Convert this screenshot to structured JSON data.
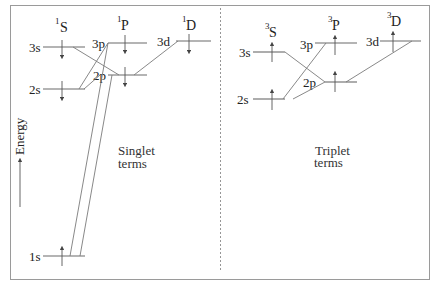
{
  "diagram": {
    "type": "energy-level-diagram",
    "axis_label": "Energy",
    "colors": {
      "lines": "#7a7a7a",
      "text": "#222222",
      "border": "#999999"
    },
    "singlet": {
      "caption_line1": "Singlet",
      "caption_line2": "terms",
      "spin_arrow": "down",
      "columns": [
        {
          "sup": "1",
          "term": "S"
        },
        {
          "sup": "1",
          "term": "P"
        },
        {
          "sup": "1",
          "term": "D"
        }
      ],
      "levels": [
        {
          "label": "3s"
        },
        {
          "label": "3p"
        },
        {
          "label": "3d"
        },
        {
          "label": "2p"
        },
        {
          "label": "2s"
        },
        {
          "label": "1s"
        }
      ]
    },
    "triplet": {
      "caption_line1": "Triplet",
      "caption_line2": "terms",
      "spin_arrow": "up",
      "columns": [
        {
          "sup": "3",
          "term": "S"
        },
        {
          "sup": "3",
          "term": "P"
        },
        {
          "sup": "3",
          "term": "D"
        }
      ],
      "levels": [
        {
          "label": "3s"
        },
        {
          "label": "3p"
        },
        {
          "label": "3d"
        },
        {
          "label": "2p"
        },
        {
          "label": "2s"
        }
      ]
    }
  }
}
